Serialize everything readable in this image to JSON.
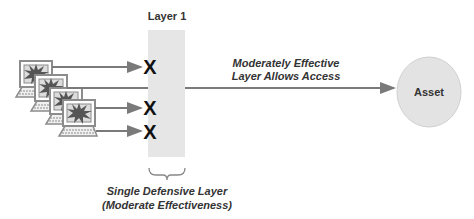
{
  "diagram": {
    "layer": {
      "label": "Layer 1",
      "fill": "#e6e6e6"
    },
    "layer_caption": [
      "Single Defensive Layer",
      "(Moderate Effectiveness)"
    ],
    "access_label": [
      "Moderately Effective",
      "Layer Allows Access"
    ],
    "asset": {
      "label": "Asset",
      "fill": "#e3e3e3"
    },
    "block_mark": "X",
    "attackers": [
      {
        "id": 1,
        "blocked": true
      },
      {
        "id": 2,
        "blocked": false
      },
      {
        "id": 3,
        "blocked": true
      },
      {
        "id": 4,
        "blocked": true
      }
    ],
    "colors": {
      "arrow": "#7a7a7a",
      "text": "#333333",
      "computer": "#8c8c8c",
      "burst": "#555555"
    }
  }
}
